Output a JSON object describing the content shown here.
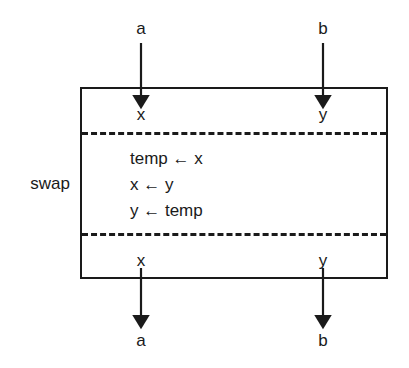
{
  "diagram": {
    "title": "swap",
    "module_label": "swap",
    "inputs": [
      {
        "external_name": "a",
        "port_name": "x"
      },
      {
        "external_name": "b",
        "port_name": "y"
      }
    ],
    "outputs": [
      {
        "external_name": "a",
        "port_name": "x"
      },
      {
        "external_name": "b",
        "port_name": "y"
      }
    ],
    "body_statements": [
      {
        "target": "temp",
        "operator": "←",
        "source": "x",
        "text": "temp ← x"
      },
      {
        "target": "x",
        "operator": "←",
        "source": "y",
        "text": "x ← y"
      },
      {
        "target": "y",
        "operator": "←",
        "source": "temp",
        "text": "y ← temp"
      }
    ],
    "colors": {
      "ink": "#1a1a1a",
      "background": "#ffffff"
    }
  }
}
